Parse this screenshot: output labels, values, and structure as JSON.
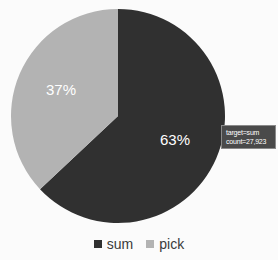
{
  "chart_data": {
    "type": "pie",
    "title": "",
    "categories": [
      "sum",
      "pick"
    ],
    "values": [
      63,
      37
    ],
    "value_labels": [
      "63%",
      "37%"
    ],
    "counts": [
      27923,
      null
    ],
    "colors": [
      "#303030",
      "#b3b3b3"
    ],
    "legend_position": "bottom",
    "grid": false,
    "start_angle_deg": 0,
    "direction": "clockwise"
  },
  "pie": {
    "slices": [
      {
        "name": "sum",
        "label": "63%",
        "percent": 63,
        "color": "#303030",
        "label_color": "#ffffff"
      },
      {
        "name": "pick",
        "label": "37%",
        "percent": 37,
        "color": "#b3b3b3",
        "label_color": "#ffffff"
      }
    ]
  },
  "tooltip": {
    "line1": "target=sum",
    "line2": "count=27,923",
    "background": "#4a4a4a",
    "text_color": "#ffffff"
  },
  "legend": {
    "items": [
      {
        "label": "sum",
        "color": "#303030"
      },
      {
        "label": "pick",
        "color": "#b3b3b3"
      }
    ]
  },
  "theme": {
    "background": "#fbfbfb",
    "dark_series": "#303030",
    "light_series": "#b3b3b3"
  }
}
